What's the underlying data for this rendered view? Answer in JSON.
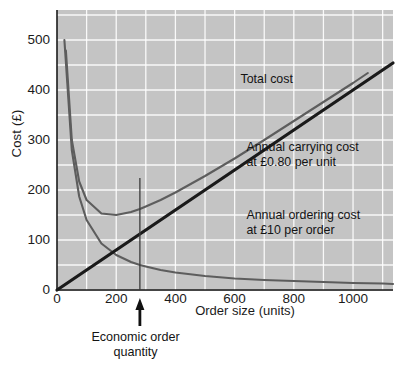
{
  "chart_data": {
    "type": "line",
    "title": "",
    "xlabel": "Order size (units)",
    "ylabel": "Cost (£)",
    "xlim": [
      0,
      1135
    ],
    "ylim": [
      0,
      560
    ],
    "xticks": [
      0,
      200,
      400,
      600,
      800,
      1000
    ],
    "yticks": [
      0,
      100,
      200,
      300,
      400,
      500
    ],
    "grid": true,
    "grid_color": "#ffffff",
    "plot_background": "#c4c4c4",
    "legend_position": "inline-annotations",
    "series": [
      {
        "name": "Annual ordering cost at £10 per order",
        "color": "#5d5d5d",
        "formula": "10 * 14000 / Q",
        "x": [
          25,
          50,
          75,
          100,
          150,
          200,
          250,
          280,
          300,
          350,
          400,
          500,
          600,
          700,
          800,
          900,
          1000,
          1100,
          1135
        ],
        "y": [
          500,
          280,
          187,
          140,
          93,
          70,
          56,
          50,
          47,
          40,
          35,
          28,
          23,
          20,
          18,
          16,
          14,
          13,
          12
        ]
      },
      {
        "name": "Annual carrying cost at £0.80 per unit",
        "color": "#1a1a1a",
        "formula": "0.80 * Q / 2",
        "x": [
          0,
          200,
          400,
          600,
          800,
          1000,
          1135
        ],
        "y": [
          0,
          80,
          160,
          240,
          320,
          400,
          454
        ]
      },
      {
        "name": "Total cost",
        "color": "#5d5d5d",
        "formula": "10*14000/Q + 0.40*Q",
        "x": [
          30,
          50,
          75,
          100,
          150,
          200,
          250,
          280,
          300,
          350,
          400,
          500,
          600,
          700,
          800,
          900,
          1000,
          1050
        ],
        "y": [
          479,
          300,
          217,
          180,
          153,
          150,
          156,
          162,
          167,
          180,
          195,
          228,
          263,
          300,
          338,
          376,
          414,
          434
        ]
      }
    ],
    "annotations": [
      {
        "name": "total-cost",
        "text": "Total cost",
        "x": 620,
        "y": 420
      },
      {
        "name": "carrying-cost",
        "text": "Annual carrying cost\nat £0.80 per unit",
        "x": 640,
        "y": 268
      },
      {
        "name": "ordering-cost",
        "text": "Annual ordering cost\nat £10 per order",
        "x": 640,
        "y": 132
      },
      {
        "name": "eoq",
        "text": "Economic order\nquantity",
        "x": 280,
        "y": -85
      }
    ],
    "markers": {
      "eoq_line": {
        "name": "economic-order-quantity-line",
        "x": 280,
        "y_from": 0,
        "y_to": 224
      },
      "eoq_arrow": {
        "name": "eoq-arrow",
        "x": 280,
        "points": "up"
      }
    }
  },
  "labels": {
    "y_axis": "Cost (£)",
    "x_axis": "Order size (units)",
    "yticks": [
      "0",
      "100",
      "200",
      "300",
      "400",
      "500"
    ],
    "xticks": [
      "0",
      "200",
      "400",
      "600",
      "800",
      "1000"
    ],
    "total_cost": "Total cost",
    "carrying_cost_line1": "Annual carrying cost",
    "carrying_cost_line2": "at £0.80 per unit",
    "ordering_cost_line1": "Annual ordering cost",
    "ordering_cost_line2": "at £10 per order",
    "eoq_line1": "Economic order",
    "eoq_line2": "quantity"
  }
}
